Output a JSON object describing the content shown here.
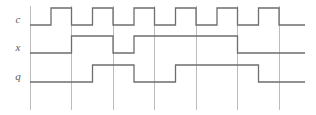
{
  "figure": {
    "kind": "digital-timing-diagram",
    "background_color": "#ffffff",
    "width": 316,
    "height": 115
  },
  "style": {
    "waveform_color": "#6e6e6e",
    "gridline_color": "#bcbcbc",
    "label_color": "#5a5a5a",
    "axis_color": "#8f8f8f"
  },
  "geometry": {
    "plot_left": 30,
    "plot_right": 305,
    "grid_spacing": 41.5,
    "gridline_top": 6,
    "gridline_bottom": 110,
    "gridlines_x": [
      30,
      71.5,
      113,
      154.5,
      196,
      237.5,
      279
    ],
    "row_low_y": [
      25,
      53,
      82
    ],
    "row_high_y": [
      8,
      36,
      65
    ],
    "label_x": 18,
    "label_y": [
      23,
      51,
      80
    ]
  },
  "signals": [
    {
      "name": "c",
      "label": "c",
      "role": "clock",
      "row": 0,
      "description": "Periodic clock, six full pulses, rises mid-period and falls on each gridline",
      "levels": [
        0,
        1,
        0,
        1,
        0,
        1,
        0,
        1,
        0,
        1,
        0,
        1,
        0
      ],
      "transitions_x": [
        30,
        51,
        71.5,
        92.5,
        113,
        134,
        154.5,
        175.5,
        196,
        217,
        237.5,
        258.5,
        279,
        305
      ],
      "points": [
        [
          30,
          25
        ],
        [
          51,
          25
        ],
        [
          51,
          8
        ],
        [
          71.5,
          8
        ],
        [
          71.5,
          25
        ],
        [
          92.5,
          25
        ],
        [
          92.5,
          8
        ],
        [
          113,
          8
        ],
        [
          113,
          25
        ],
        [
          134,
          25
        ],
        [
          134,
          8
        ],
        [
          154.5,
          8
        ],
        [
          154.5,
          25
        ],
        [
          175.5,
          25
        ],
        [
          175.5,
          8
        ],
        [
          196,
          8
        ],
        [
          196,
          25
        ],
        [
          217,
          25
        ],
        [
          217,
          8
        ],
        [
          237.5,
          8
        ],
        [
          237.5,
          25
        ],
        [
          258.5,
          25
        ],
        [
          258.5,
          8
        ],
        [
          279,
          8
        ],
        [
          279,
          25
        ],
        [
          305,
          25
        ]
      ]
    },
    {
      "name": "x",
      "label": "x",
      "role": "input",
      "row": 1,
      "description": "Input: low, high for one period, brief low dip, then high for three periods, then low",
      "levels": [
        0,
        1,
        0,
        1,
        0
      ],
      "transitions_x": [
        30,
        71.5,
        113,
        134,
        237.5,
        305
      ],
      "points": [
        [
          30,
          53
        ],
        [
          71.5,
          53
        ],
        [
          71.5,
          36
        ],
        [
          113,
          36
        ],
        [
          113,
          53
        ],
        [
          134,
          53
        ],
        [
          134,
          36
        ],
        [
          237.5,
          36
        ],
        [
          237.5,
          53
        ],
        [
          305,
          53
        ]
      ]
    },
    {
      "name": "q",
      "label": "q",
      "role": "output",
      "row": 2,
      "description": "Output: low, pulse high for one period, low, then high for two periods, then low",
      "levels": [
        0,
        1,
        0,
        1,
        0
      ],
      "transitions_x": [
        30,
        92.5,
        134,
        175.5,
        258.5,
        305
      ],
      "points": [
        [
          30,
          82
        ],
        [
          92.5,
          82
        ],
        [
          92.5,
          65
        ],
        [
          134,
          65
        ],
        [
          134,
          82
        ],
        [
          175.5,
          82
        ],
        [
          175.5,
          65
        ],
        [
          258.5,
          65
        ],
        [
          258.5,
          82
        ],
        [
          305,
          82
        ]
      ]
    }
  ]
}
